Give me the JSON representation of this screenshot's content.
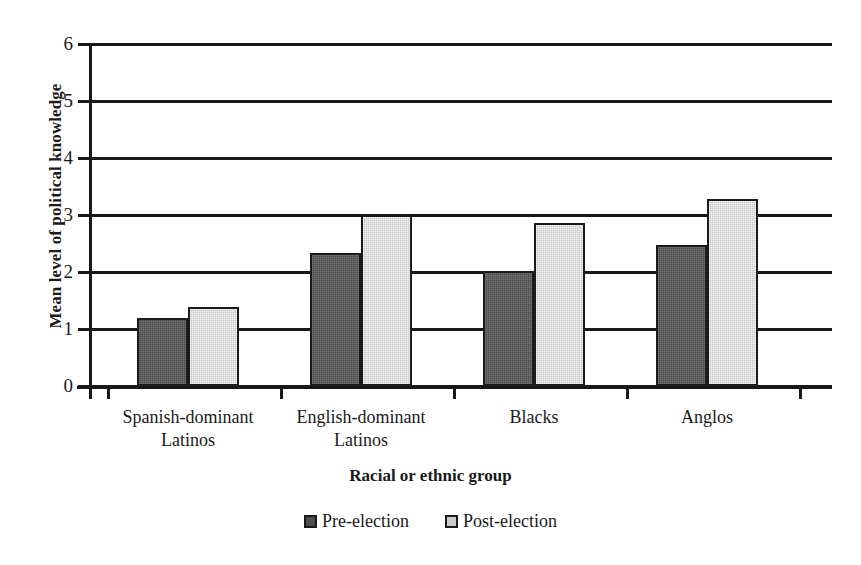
{
  "chart_data": {
    "type": "bar",
    "title": "",
    "xlabel": "Racial or ethnic group",
    "ylabel": "Mean level of political knowledge",
    "categories": [
      "Spanish-dominant Latinos",
      "English-dominant Latinos",
      "Blacks",
      "Anglos"
    ],
    "category_lines": [
      [
        "Spanish-dominant",
        "Latinos"
      ],
      [
        "English-dominant",
        "Latinos"
      ],
      [
        "Blacks"
      ],
      [
        "Anglos"
      ]
    ],
    "series": [
      {
        "name": "Pre-election",
        "color": "#4d4d4d",
        "values": [
          1.19,
          2.33,
          2.02,
          2.47
        ]
      },
      {
        "name": "Post-election",
        "color": "#c9c9c9",
        "values": [
          1.39,
          3.0,
          2.86,
          3.28
        ]
      }
    ],
    "ylim": [
      0,
      6
    ],
    "ytick_labels": [
      "0",
      "1",
      "2",
      "3",
      "4",
      "5",
      "6"
    ],
    "grid": true,
    "legend_position": "bottom"
  },
  "axes": {
    "y_title": "Mean level of political knowledge",
    "x_title": "Racial or ethnic group"
  },
  "legend": {
    "items": [
      {
        "label": "Pre-election"
      },
      {
        "label": "Post-election"
      }
    ]
  }
}
